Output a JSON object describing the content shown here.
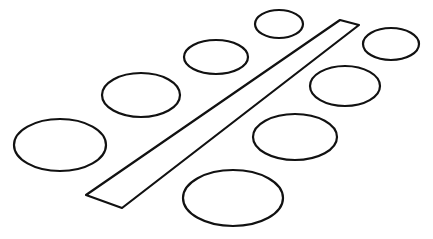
{
  "diagram": {
    "colors": {
      "stroke": "#111111",
      "background": "#ffffff"
    },
    "stroke_width": 2.2,
    "table": {
      "points": "340,20 359,25 122,208 86,195"
    },
    "seats_left": [
      {
        "cx": 279,
        "cy": 24,
        "rx": 24,
        "ry": 14
      },
      {
        "cx": 216,
        "cy": 57,
        "rx": 32,
        "ry": 17
      },
      {
        "cx": 141,
        "cy": 95,
        "rx": 39,
        "ry": 22
      },
      {
        "cx": 60,
        "cy": 145,
        "rx": 46,
        "ry": 26
      }
    ],
    "seats_right": [
      {
        "cx": 391,
        "cy": 44,
        "rx": 28,
        "ry": 16
      },
      {
        "cx": 345,
        "cy": 86,
        "rx": 35,
        "ry": 20
      },
      {
        "cx": 295,
        "cy": 137,
        "rx": 42,
        "ry": 23
      },
      {
        "cx": 233,
        "cy": 198,
        "rx": 50,
        "ry": 28
      }
    ]
  }
}
